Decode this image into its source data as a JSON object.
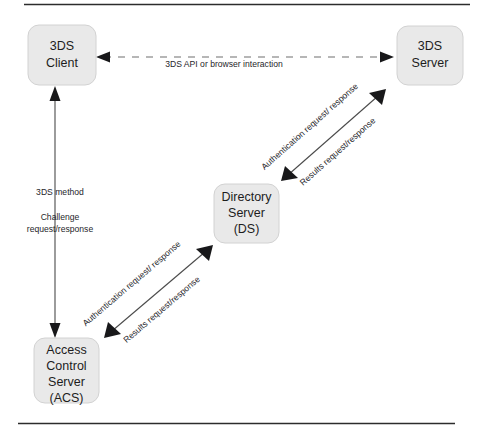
{
  "diagram": {
    "type": "flow-diagram",
    "nodes": [
      {
        "id": "3ds-client",
        "lines": [
          "3DS",
          "Client"
        ],
        "x": 28,
        "y": 25,
        "w": 68,
        "h": 60
      },
      {
        "id": "3ds-server",
        "lines": [
          "3DS",
          "Server"
        ],
        "x": 397,
        "y": 26,
        "w": 66,
        "h": 59
      },
      {
        "id": "directory-server",
        "lines": [
          "Directory",
          "Server",
          "(DS)"
        ],
        "x": 214,
        "y": 184,
        "w": 65,
        "h": 59
      },
      {
        "id": "acs",
        "lines": [
          "Access",
          "Control",
          "Server",
          "(ACS)"
        ],
        "x": 34,
        "y": 338,
        "w": 65,
        "h": 65
      }
    ],
    "edges": [
      {
        "id": "client-server",
        "from": "3ds-client",
        "to": "3ds-server",
        "style": "dashed",
        "direction": "both",
        "labels": [
          "3DS API or browser interaction"
        ]
      },
      {
        "id": "client-acs",
        "from": "3ds-client",
        "to": "acs",
        "style": "solid",
        "direction": "both",
        "labels": [
          "3DS method",
          "Challenge",
          "request/response"
        ]
      },
      {
        "id": "ds-server",
        "from": "directory-server",
        "to": "3ds-server",
        "style": "solid",
        "direction": "both",
        "labels": [
          "Authentication request/ response",
          "Results request/response"
        ]
      },
      {
        "id": "acs-ds",
        "from": "acs",
        "to": "directory-server",
        "style": "solid",
        "direction": "both",
        "labels": [
          "Authentication request/ response",
          "Results request/response"
        ]
      }
    ],
    "edge_label_text": {
      "client_server": "3DS API or browser interaction",
      "client_acs_1": "3DS method",
      "client_acs_2": "Challenge",
      "client_acs_3": "request/response",
      "ds_server_auth": "Authentication request/ response",
      "ds_server_results": "Results request/response",
      "acs_ds_auth": "Authentication request/ response",
      "acs_ds_results": "Results request/response"
    },
    "node_text": {
      "client_l1": "3DS",
      "client_l2": "Client",
      "server_l1": "3DS",
      "server_l2": "Server",
      "ds_l1": "Directory",
      "ds_l2": "Server",
      "ds_l3": "(DS)",
      "acs_l1": "Access",
      "acs_l2": "Control",
      "acs_l3": "Server",
      "acs_l4": "(ACS)"
    },
    "colors": {
      "node_fill": "#e9e9e9",
      "node_stroke": "#d2d2d2",
      "edge": "#4a4a4a",
      "dashed_edge": "#6e6e6e",
      "text": "#1d1d1d",
      "rule": "#2c2c2c",
      "background": "#ffffff"
    }
  }
}
